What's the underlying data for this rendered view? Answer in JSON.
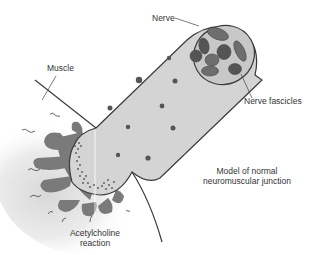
{
  "title": "Model of normal neuromuscular junction",
  "labels": {
    "nerve": "Nerve",
    "muscle": "Muscle",
    "nerve_fascicles": "Nerve fascicles",
    "model_line1": "Model of normal",
    "model_line2": "neuromuscular junction",
    "ach_line1": "Acetylcholine",
    "ach_line2": "reaction"
  },
  "colors": {
    "background": "#ffffff",
    "nerve_fill": "#d4d4d4",
    "nerve_outline": "#3a3a3a",
    "fascicle_fill": "#6e6e6e",
    "fascicle_dark": "#555555",
    "endplate_fill": "#7a7a7a",
    "muscle_shade": "#e6e6e6",
    "dots": "#555555",
    "text": "#333333"
  }
}
